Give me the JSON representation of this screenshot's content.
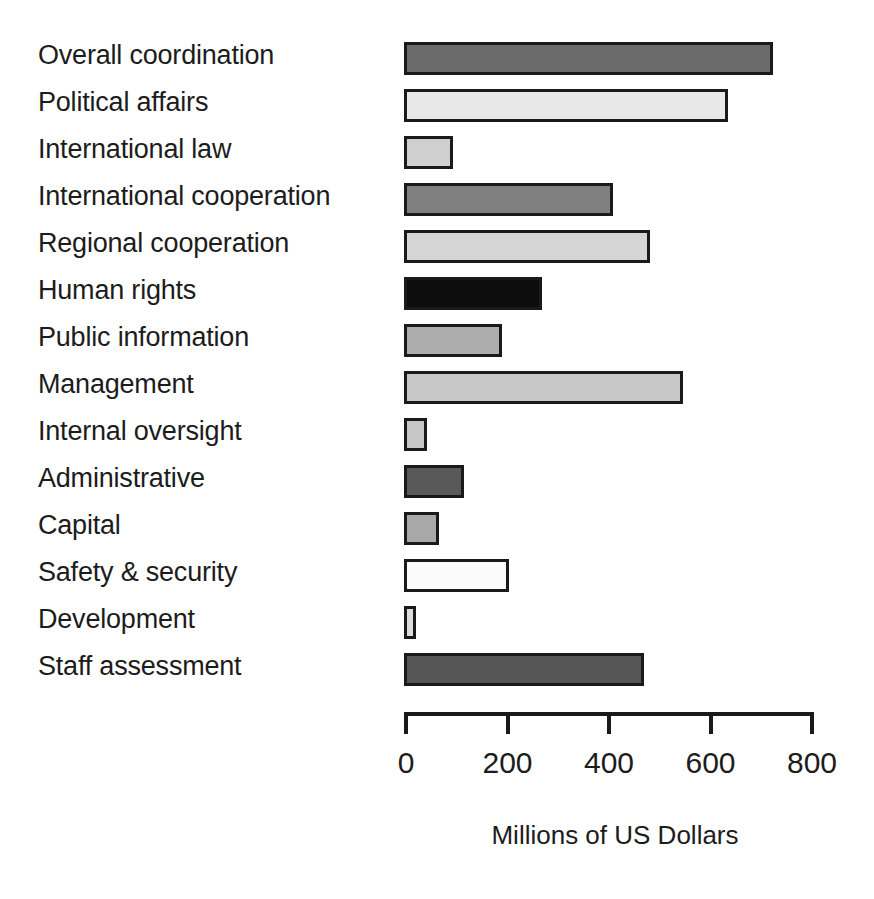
{
  "chart_data": {
    "type": "bar",
    "orientation": "horizontal",
    "title": "",
    "xlabel": "Millions of US Dollars",
    "ylabel": "",
    "xlim": [
      0,
      800
    ],
    "xticks": [
      0,
      200,
      400,
      600,
      800
    ],
    "xtick_labels": [
      "0",
      "200",
      "400",
      "600",
      "800"
    ],
    "grid": false,
    "legend": false,
    "categories": [
      "Overall coordination",
      "Political affairs",
      "International law",
      "International cooperation",
      "Regional cooperation",
      "Human rights",
      "Public information",
      "Management",
      "Internal oversight",
      "Administrative",
      "Capital",
      "Safety & security",
      "Development",
      "Staff assessment"
    ],
    "values": [
      727,
      638,
      97,
      412,
      485,
      272,
      193,
      550,
      45,
      118,
      69,
      207,
      24,
      473
    ],
    "bar_colors": [
      "#6b6b6b",
      "#e8e8e8",
      "#cfcfcf",
      "#808080",
      "#d5d5d5",
      "#0d0d0d",
      "#adadad",
      "#c8c8c8",
      "#c6c6c6",
      "#595959",
      "#a8a8a8",
      "#fbfbfb",
      "#dcdcdc",
      "#565656"
    ],
    "bar_edge_color": "#1a1a1a",
    "axis_color": "#1a1a1a",
    "background_color": "#ffffff"
  }
}
